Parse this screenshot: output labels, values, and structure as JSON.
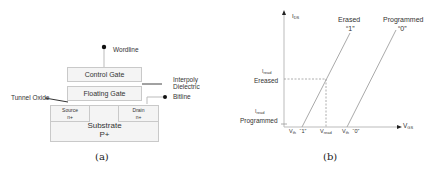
{
  "panel_a": {
    "caption": "(a)",
    "labels": {
      "wordline": "Wordline",
      "control_gate": "Control Gate",
      "interpoly_line1": "Interpoly",
      "interpoly_line2": "Dielectric",
      "floating_gate": "Floating Gate",
      "bitline": "Bitline",
      "tunnel_oxide": "Tunnel Oxide",
      "source": "Source",
      "source_dop": "n+",
      "drain": "Drain",
      "drain_dop": "n+",
      "substrate": "Substrate",
      "substrate_dop": "P+"
    }
  },
  "panel_b": {
    "caption": "(b)",
    "y_axis": {
      "label": "I",
      "sub": "DS"
    },
    "x_axis": {
      "label": "V",
      "sub": "GS"
    },
    "curves": {
      "erased_name": "Erased",
      "erased_bit": "“1”",
      "programmed_name": "Programmed",
      "programmed_bit": "“0”"
    },
    "y_ticks": {
      "iread_erased_top": "I",
      "iread_erased_sub": "read",
      "iread_erased_name": "Ereased",
      "iread_prog_top": "I",
      "iread_prog_sub": "read",
      "iread_prog_name": "Programmed"
    },
    "x_ticks": {
      "vth1": "V",
      "vth1_sub": "th",
      "vth1_bit": "“1”",
      "vread": "V",
      "vread_sub": "read",
      "vth0": "V",
      "vth0_sub": "th",
      "vth0_bit": "“0”"
    }
  }
}
